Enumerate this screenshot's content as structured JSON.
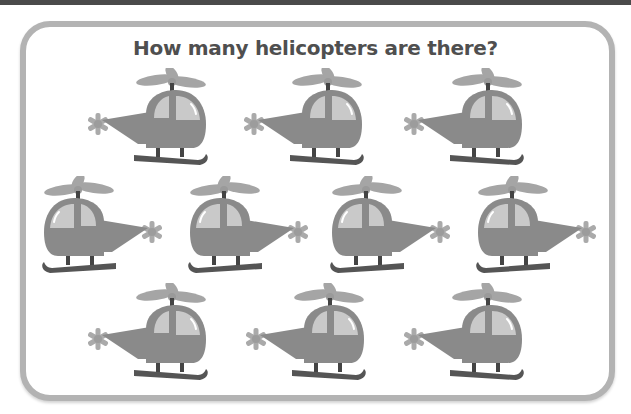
{
  "question": {
    "title": "How many helicopters are there?"
  },
  "colors": {
    "frame_border": "#b3b3b3",
    "title_text": "#4f4f4f",
    "helicopter_body": "#8a8a8a",
    "helicopter_window": "#c9c9c9",
    "helicopter_rotor": "#a5a5a5",
    "helicopter_skid": "#555555",
    "top_bar": "#4a4a4a"
  },
  "helicopters": [
    {
      "row": 1,
      "facing": "right",
      "x": 88,
      "y": 68
    },
    {
      "row": 1,
      "facing": "right",
      "x": 244,
      "y": 68
    },
    {
      "row": 1,
      "facing": "right",
      "x": 404,
      "y": 68
    },
    {
      "row": 2,
      "facing": "left",
      "x": 40,
      "y": 176
    },
    {
      "row": 2,
      "facing": "left",
      "x": 186,
      "y": 176
    },
    {
      "row": 2,
      "facing": "left",
      "x": 328,
      "y": 176
    },
    {
      "row": 2,
      "facing": "left",
      "x": 474,
      "y": 176
    },
    {
      "row": 3,
      "facing": "right",
      "x": 88,
      "y": 283
    },
    {
      "row": 3,
      "facing": "right",
      "x": 246,
      "y": 283
    },
    {
      "row": 3,
      "facing": "right",
      "x": 404,
      "y": 283
    }
  ],
  "helicopter_count_visible": 10
}
